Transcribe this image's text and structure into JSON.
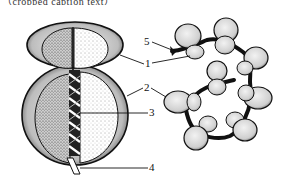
{
  "figure": {
    "cropped_top_text": "（cropped caption text）",
    "left_panel": "single-ribosome",
    "right_panel": "polyribosome"
  },
  "labels": [
    {
      "id": "1",
      "text": "1",
      "meaning": "small-subunit"
    },
    {
      "id": "2",
      "text": "2",
      "meaning": "large-subunit"
    },
    {
      "id": "3",
      "text": "3",
      "meaning": "channel"
    },
    {
      "id": "4",
      "text": "4",
      "meaning": "polypeptide"
    },
    {
      "id": "5",
      "text": "5",
      "meaning": "mRNA"
    }
  ],
  "colors": {
    "ink": "#111111",
    "shade": "#555555",
    "paper": "#ffffff"
  }
}
